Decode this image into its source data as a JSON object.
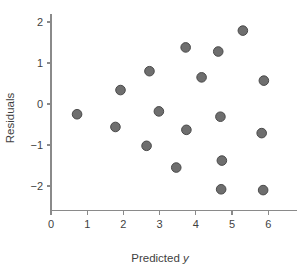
{
  "chart_data": {
    "type": "scatter",
    "title": "",
    "xlabel": "Predicted y",
    "ylabel": "Residuals",
    "xlim": [
      0,
      6.8
    ],
    "ylim": [
      -2.6,
      2.2
    ],
    "grid": false,
    "legend": null,
    "marker": {
      "shape": "circle",
      "fill": "#6e6e6e",
      "edge": "#4a4a4a",
      "size_px": 5.6
    },
    "xticks": [
      0,
      1,
      2,
      3,
      4,
      5,
      6
    ],
    "xtick_labels": [
      "0",
      "1",
      "2",
      "3",
      "4",
      "5",
      "6"
    ],
    "yticks": [
      -2,
      -1,
      0,
      1,
      2
    ],
    "ytick_labels": [
      "−2",
      "−1",
      "0",
      "1",
      "2"
    ],
    "points": [
      {
        "x": 0.72,
        "y": -0.25
      },
      {
        "x": 1.78,
        "y": -0.56
      },
      {
        "x": 1.92,
        "y": 0.34
      },
      {
        "x": 2.64,
        "y": -1.02
      },
      {
        "x": 2.72,
        "y": 0.8
      },
      {
        "x": 2.98,
        "y": -0.18
      },
      {
        "x": 3.46,
        "y": -1.55
      },
      {
        "x": 3.72,
        "y": 1.38
      },
      {
        "x": 3.74,
        "y": -0.63
      },
      {
        "x": 4.16,
        "y": 0.65
      },
      {
        "x": 4.62,
        "y": 1.28
      },
      {
        "x": 4.68,
        "y": -0.31
      },
      {
        "x": 4.72,
        "y": -1.38
      },
      {
        "x": 4.7,
        "y": -2.08
      },
      {
        "x": 5.3,
        "y": 1.79
      },
      {
        "x": 5.82,
        "y": -0.71
      },
      {
        "x": 5.88,
        "y": 0.57
      },
      {
        "x": 5.86,
        "y": -2.1
      }
    ]
  },
  "axis_labels": {
    "x_title_prefix": "Predicted ",
    "x_title_italic": "y",
    "y_title": "Residuals"
  }
}
